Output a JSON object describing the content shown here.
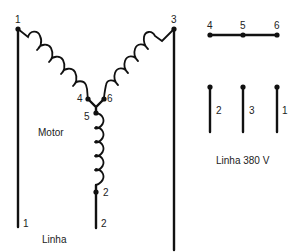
{
  "diagram": {
    "motor": {
      "label": "Motor",
      "terminals": [
        {
          "id": "t1",
          "label": "1"
        },
        {
          "id": "t3",
          "label": "3"
        },
        {
          "id": "t4",
          "label": "4"
        },
        {
          "id": "t5",
          "label": "5"
        },
        {
          "id": "t6",
          "label": "6"
        },
        {
          "id": "t2",
          "label": "2"
        }
      ],
      "line_leads": [
        {
          "id": "lead1",
          "label": "1"
        },
        {
          "id": "lead2",
          "label": "2"
        }
      ],
      "line_label": "Linha"
    },
    "terminal_block": {
      "top_bar_labels": [
        "4",
        "5",
        "6"
      ],
      "bottom_leads": [
        "2",
        "3",
        "1"
      ],
      "caption": "Linha 380 V"
    }
  }
}
